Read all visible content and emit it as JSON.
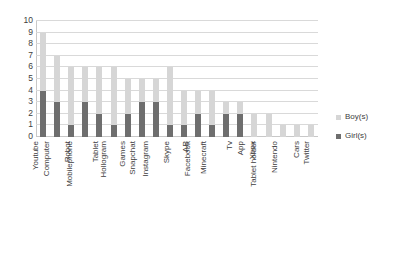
{
  "chart_data": {
    "type": "bar",
    "title": "",
    "subtitle": "",
    "xlabel": "",
    "ylabel": "",
    "ylim": [
      0,
      10
    ],
    "ytick_labels": [
      "10",
      "9",
      "8",
      "7",
      "6",
      "5",
      "4",
      "3",
      "2",
      "1",
      "0"
    ],
    "ytick_values": [
      10,
      9,
      8,
      7,
      6,
      5,
      4,
      3,
      2,
      1,
      0
    ],
    "grid": true,
    "stacked": true,
    "legend_position": "right",
    "categories": [
      "Youtube",
      "Computer",
      "Robot",
      "Mobilephone",
      "Tablet",
      "Hollogram",
      "Games",
      "Snapchat",
      "Instagram",
      "Skype",
      "AR",
      "Facebook",
      "Minecraft",
      "Tv",
      "App",
      "Xbox",
      "Tablet holder",
      "Nintendo",
      "Cars",
      "Twitter"
    ],
    "series": [
      {
        "name": "Girl(s)",
        "color": "#6e6e6e",
        "values": [
          4,
          3,
          1,
          3,
          2,
          1,
          2,
          3,
          3,
          1,
          1,
          2,
          1,
          2,
          2,
          0,
          0,
          0,
          0,
          0
        ]
      },
      {
        "name": "Boy(s)",
        "color": "#d6d6d6",
        "values": [
          5,
          4,
          5,
          3,
          4,
          5,
          3,
          2,
          2,
          5,
          3,
          2,
          3,
          1,
          1,
          2,
          2,
          1,
          1,
          1
        ]
      }
    ],
    "totals": [
      9,
      7,
      6,
      6,
      6,
      6,
      5,
      5,
      5,
      6,
      4,
      4,
      4,
      3,
      3,
      2,
      2,
      1,
      1,
      1
    ]
  },
  "legend": {
    "entries": [
      {
        "label": "Boy(s)",
        "color": "#d6d6d6"
      },
      {
        "label": "Girl(s)",
        "color": "#6e6e6e"
      }
    ]
  },
  "colors": {
    "boy": "#d6d6d6",
    "girl": "#6e6e6e",
    "grid": "#d9d9d9",
    "axis": "#c8c8c8",
    "text": "#3d3d3d",
    "background": "#ffffff"
  }
}
